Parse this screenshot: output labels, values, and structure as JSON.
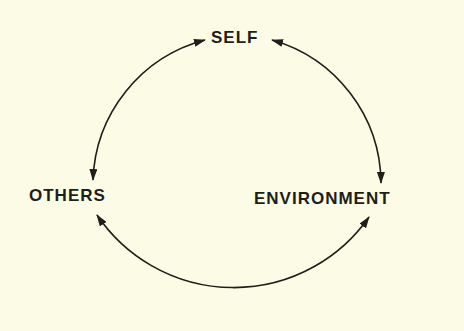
{
  "diagram": {
    "nodes": [
      {
        "id": "self",
        "label": "SELF"
      },
      {
        "id": "others",
        "label": "OTHERS"
      },
      {
        "id": "environment",
        "label": "ENVIRONMENT"
      }
    ],
    "edges": [
      {
        "from": "self",
        "to": "others",
        "direction": "bidirectional"
      },
      {
        "from": "self",
        "to": "environment",
        "direction": "bidirectional"
      },
      {
        "from": "others",
        "to": "environment",
        "direction": "bidirectional"
      }
    ],
    "colors": {
      "background": "#fcfce6",
      "ink": "#1e1e1a"
    }
  }
}
